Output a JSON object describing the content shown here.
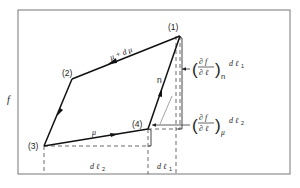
{
  "diagram": {
    "axis_label_y": "f",
    "points": [
      {
        "id": "1",
        "label": "(1)"
      },
      {
        "id": "2",
        "label": "(2)"
      },
      {
        "id": "3",
        "label": "(3)"
      },
      {
        "id": "4",
        "label": "(4)"
      }
    ],
    "edges": [
      {
        "from": "1",
        "to": "2",
        "label": "μ + d μ"
      },
      {
        "from": "2",
        "to": "3",
        "label": ""
      },
      {
        "from": "3",
        "to": "4",
        "label": "μ"
      },
      {
        "from": "4",
        "to": "1",
        "label": "n"
      }
    ],
    "annotations": {
      "upper": {
        "numerator": "∂ f",
        "denominator": "∂ ℓ",
        "subscript": "n",
        "suffix": "d ℓ",
        "suffix_sub": "1"
      },
      "lower": {
        "numerator": "∂ f",
        "denominator": "∂ ℓ",
        "subscript": "μ",
        "suffix": "d ℓ",
        "suffix_sub": "2"
      }
    },
    "intervals": {
      "dl2": {
        "text": "d ℓ",
        "sub": "2"
      },
      "dl1": {
        "text": "d ℓ",
        "sub": "1"
      }
    },
    "colors": {
      "line": "#222222",
      "frame": "#777777"
    }
  }
}
